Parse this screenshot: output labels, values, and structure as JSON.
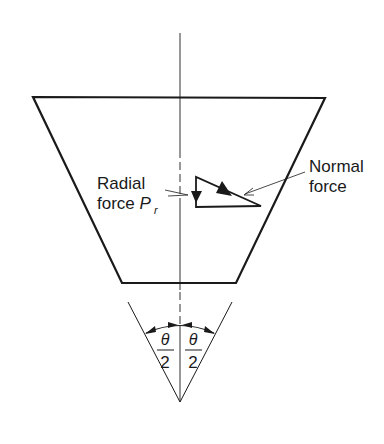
{
  "diagram": {
    "title": "",
    "labels": {
      "radial_line1": "Radial",
      "radial_line2": "force ",
      "radial_symbol": "P",
      "radial_subscript": "r",
      "normal_line1": "Normal",
      "normal_line2": "force",
      "theta_left_num": "θ",
      "theta_left_den": "2",
      "theta_right_num": "θ",
      "theta_right_den": "2"
    },
    "colors": {
      "stroke": "#1a1a1a",
      "background": "#ffffff"
    }
  }
}
